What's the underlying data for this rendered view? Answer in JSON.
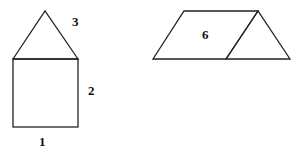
{
  "diagram": {
    "figures": [
      {
        "name": "house",
        "description": "triangle on top of a square",
        "labels": [
          {
            "id": "square-bottom",
            "text": "1"
          },
          {
            "id": "square-right",
            "text": "2"
          },
          {
            "id": "triangle-side",
            "text": "3"
          }
        ]
      },
      {
        "name": "parallelogram-with-triangle",
        "description": "parallelogram with adjoined triangle on the right",
        "labels": [
          {
            "id": "parallelogram-center",
            "text": "6"
          }
        ]
      }
    ],
    "colors": {
      "stroke": "#222222",
      "text": "#111111",
      "background": "#ffffff"
    }
  }
}
